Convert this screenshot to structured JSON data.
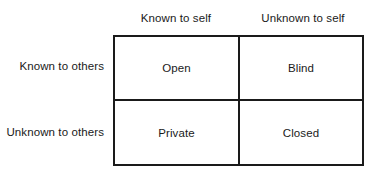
{
  "diagram": {
    "type": "johari-window-2x2-matrix",
    "column_headers": [
      "Known to self",
      "Unknown to self"
    ],
    "row_labels": [
      "Known to others",
      "Unknown to others"
    ],
    "cells": [
      [
        "Open",
        "Blind"
      ],
      [
        "Private",
        "Closed"
      ]
    ],
    "colors": {
      "line": "#1a1a1a",
      "text": "#1a1a1a",
      "background": "#ffffff"
    }
  }
}
